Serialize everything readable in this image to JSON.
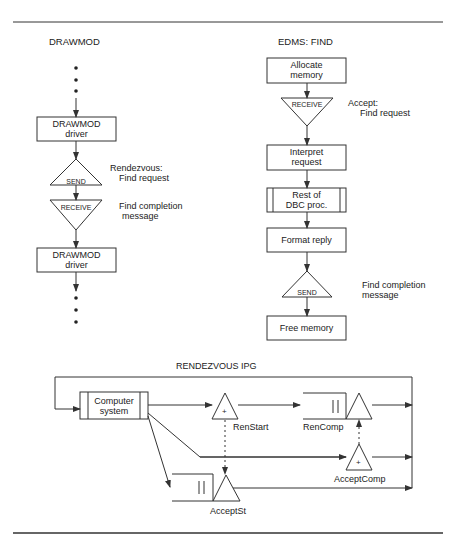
{
  "drawmod": {
    "title": "DRAWMOD",
    "box1": [
      "DRAWMOD",
      "driver"
    ],
    "send": "SEND",
    "send_note": [
      "Rendezvous:",
      "Find request"
    ],
    "receive": "RECEIVE",
    "receive_note": [
      "Find completion",
      "message"
    ],
    "box2": [
      "DRAWMOD",
      "driver"
    ]
  },
  "edms": {
    "title": "EDMS:  FIND",
    "allocate": [
      "Allocate",
      "memory"
    ],
    "receive": "RECEIVE",
    "receive_note": [
      "Accept:",
      "Find request"
    ],
    "interpret": [
      "Interpret",
      "request"
    ],
    "rest": [
      "Rest of",
      "DBC proc."
    ],
    "format": "Format reply",
    "send": "SEND",
    "send_note": [
      "Find completion",
      "message"
    ],
    "free": "Free memory"
  },
  "ipg": {
    "title": "RENDEZVOUS IPG",
    "computer": [
      "Computer",
      "system"
    ],
    "ren_start": "RenStart",
    "ren_comp": "RenComp",
    "accept_comp": "AcceptComp",
    "accept_st": "AcceptSt",
    "plus": "+",
    "queue_mark": "||"
  },
  "colors": {
    "line": "#333333",
    "text": "#222222",
    "background": "#ffffff"
  }
}
